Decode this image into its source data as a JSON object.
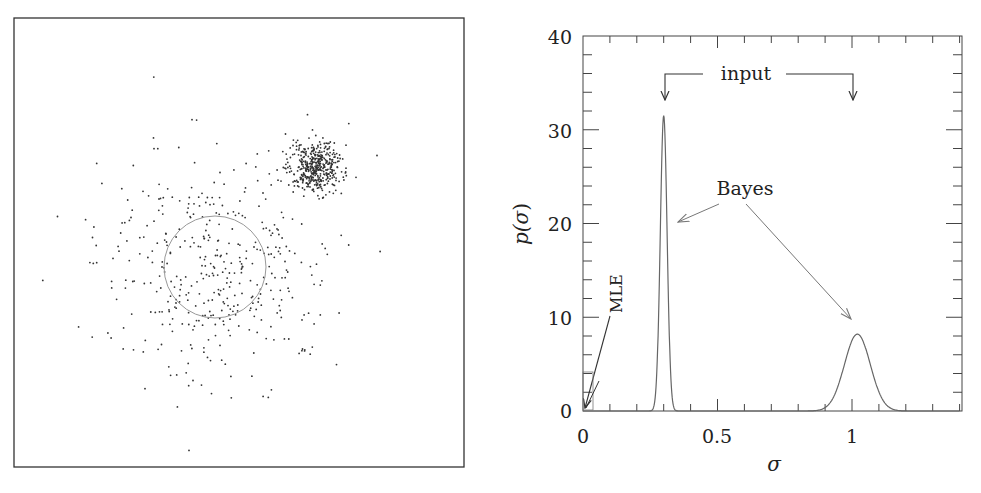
{
  "chart_data": [
    {
      "type": "scatter",
      "title": "",
      "description": "Simulated 2D point distribution: broad diffuse population with a circle marking its scale, plus a compact dense cluster at upper right",
      "series": [
        {
          "name": "broad-population",
          "center": [
            215,
            267
          ],
          "spread_px": 70,
          "count": 420
        },
        {
          "name": "compact-cluster",
          "center": [
            315,
            167
          ],
          "spread_px": 13,
          "count": 450
        }
      ],
      "circle": {
        "center": [
          215,
          267
        ],
        "radius_px": 51
      },
      "axes_visible": false,
      "frame": true
    },
    {
      "type": "line",
      "title": "",
      "xlabel": "σ",
      "ylabel": "p(σ)",
      "xlim": [
        0,
        1.4
      ],
      "ylim": [
        0,
        40
      ],
      "xticks": [
        "0",
        "0.5",
        "1"
      ],
      "yticks": [
        "0",
        "10",
        "20",
        "30",
        "40"
      ],
      "grid": false,
      "series": [
        {
          "name": "Bayes posterior (narrow)",
          "peak_x": 0.3,
          "peak_y": 31.5,
          "width_sigma": 0.0127
        },
        {
          "name": "Bayes posterior (broad)",
          "peak_x": 1.02,
          "peak_y": 8.2,
          "width_sigma": 0.048
        }
      ],
      "annotations": [
        {
          "text": "input",
          "arrows_to_x": [
            0.3,
            1.0
          ]
        },
        {
          "text": "Bayes",
          "arrows_to": [
            [
              0.35,
              20
            ],
            [
              1.0,
              10
            ]
          ]
        },
        {
          "text": "MLE",
          "arrows_to": [
            [
              0.0,
              0.0
            ]
          ]
        }
      ]
    }
  ],
  "labels": {
    "x_axis": "σ",
    "y_axis_p": "p(",
    "y_axis_sigma": "σ",
    "y_axis_close": ")",
    "input": "input",
    "bayes": "Bayes",
    "mle": "MLE",
    "xtick_0": "0",
    "xtick_05": "0.5",
    "xtick_1": "1",
    "ytick_0": "0",
    "ytick_10": "10",
    "ytick_20": "20",
    "ytick_30": "30",
    "ytick_40": "40"
  }
}
